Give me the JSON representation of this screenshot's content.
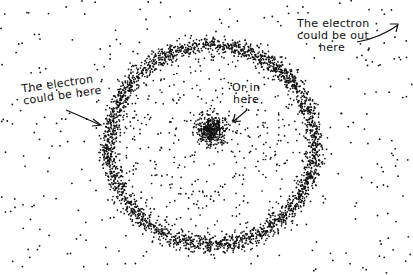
{
  "diagram": {
    "labels": {
      "here_line1": "The electron",
      "here_line2": "could be here",
      "out_line1": "The electron",
      "out_line2": "could be out",
      "out_line3": "here",
      "in_line1": "Or in",
      "in_line2": "here"
    },
    "ring": {
      "cx": 212,
      "cy": 145,
      "rx": 103,
      "ry": 100
    },
    "nucleus": {
      "cx": 212,
      "cy": 130,
      "r": 14
    },
    "colors": {
      "ink": "#111111",
      "background": "#ffffff"
    }
  }
}
